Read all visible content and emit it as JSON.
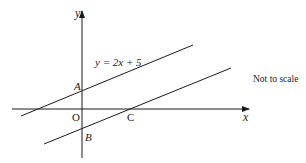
{
  "diagram": {
    "type": "coordinate-geometry",
    "axes": {
      "x_label": "x",
      "y_label": "y",
      "origin_label": "O"
    },
    "lines": [
      {
        "id": "line-1",
        "equation": "y = 2x + 5",
        "y_intercept_point": "A"
      },
      {
        "id": "line-2",
        "parallel_to": "line-1",
        "y_intercept_point": "B",
        "x_intercept_point": "C"
      }
    ],
    "points": {
      "A": "A",
      "B": "B",
      "C": "C"
    },
    "note": "Not to scale",
    "colors": {
      "ink": "#1a1a1a",
      "background": "#ffffff"
    }
  }
}
